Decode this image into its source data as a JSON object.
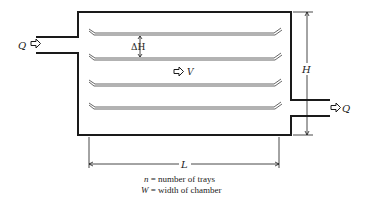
{
  "diagram": {
    "labels": {
      "inflow": "Q",
      "outflow": "Q",
      "tray_spacing": "ΔH",
      "velocity": "V",
      "height": "H",
      "length": "L"
    },
    "caption": [
      {
        "symbol": "n",
        "text": " = number of trays"
      },
      {
        "symbol": "W",
        "text": " = width of chamber"
      }
    ],
    "trays": [
      {
        "y": 33
      },
      {
        "y": 58
      },
      {
        "y": 84
      },
      {
        "y": 107
      }
    ],
    "colors": {
      "line": "#1a1a1a",
      "tray": "#555555",
      "background": "#ffffff"
    }
  }
}
